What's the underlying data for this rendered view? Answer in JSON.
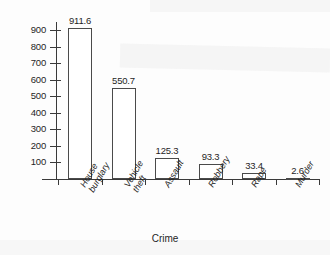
{
  "chart_data": {
    "type": "bar",
    "title": "",
    "xlabel": "Crime",
    "ylabel": "",
    "categories": [
      "House\nburglary",
      "Vehicle\ntheft",
      "Assault",
      "Robbery",
      "Rape",
      "Murder"
    ],
    "values": [
      911.6,
      550.7,
      125.3,
      93.3,
      33.4,
      2.6
    ],
    "value_labels": [
      "911.6",
      "550.7",
      "125.3",
      "93.3",
      "33.4",
      "2.6"
    ],
    "ylim": [
      0,
      950
    ],
    "y_ticks": [
      100,
      200,
      300,
      400,
      500,
      600,
      700,
      800,
      900
    ],
    "y_tick_labels": [
      "100",
      "200",
      "300",
      "400",
      "500",
      "600",
      "700",
      "800",
      "900"
    ],
    "grid": false,
    "legend": false,
    "bar_fill": "#ffffff",
    "bar_edge": "#4a4a4a",
    "axis_color": "#3a3a3a"
  },
  "axis": {
    "x_title": "Crime"
  }
}
